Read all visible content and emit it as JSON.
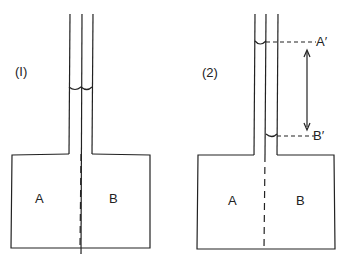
{
  "diagram1": {
    "label": "(I)",
    "chamber_left": "A",
    "chamber_right": "B"
  },
  "diagram2": {
    "label": "(2)",
    "chamber_left": "A",
    "chamber_right": "B",
    "level_top": "A′",
    "level_bottom": "B′"
  },
  "colors": {
    "line": "#222222",
    "background": "#ffffff"
  }
}
